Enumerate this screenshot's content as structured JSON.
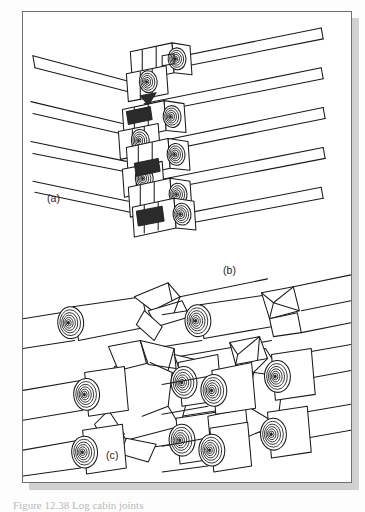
{
  "page": {
    "kind": "scanned-book-figure-plate",
    "background_color": "#fdfdfd",
    "plate_background": "#ffffff",
    "plate_border_color": "#6f6f6f",
    "shadow_color": "#c9c9c9",
    "ink_color": "#1a1a1a"
  },
  "figure": {
    "drawing_style": "pen-and-ink line drawing",
    "panels": [
      {
        "id": "a",
        "label": "(a)",
        "description": "Tall stacked corner of a log wall showing successive saddle-notched log ends, five courses, drawn in axonometric view with log ends showing concentric growth rings"
      },
      {
        "id": "b",
        "label": "(b)",
        "description": "Label for the upper-right corner joint detail group"
      },
      {
        "id": "c",
        "label": "(c)",
        "description": "Two enlarged corner joint details, left and right, each showing interlocking notched log ends with growth rings"
      }
    ]
  },
  "caption": {
    "text": "Figure 12.38  Log cabin joints",
    "visible": "clipped-at-page-bottom"
  }
}
